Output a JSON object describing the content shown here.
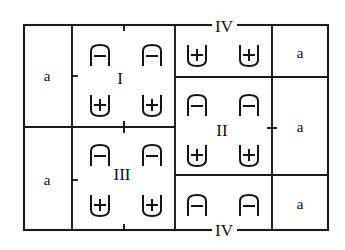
{
  "diagram": {
    "type": "physics-region-sketch",
    "outer_border": {
      "x": 24,
      "y": 25,
      "width": 304,
      "height": 205
    },
    "colors": {
      "line": "#1a1a1a",
      "glyph": "#141414",
      "background": "#ffffff",
      "text": "#111111"
    },
    "grid": {
      "vertical_lines_x": [
        24,
        72,
        175,
        272,
        328
      ],
      "horizontal_lines_left_y": [
        25,
        127,
        230
      ],
      "horizontal_lines_right_y": [
        25,
        77,
        175,
        230
      ]
    },
    "region_labels": [
      {
        "name": "region-I",
        "text": "I",
        "x": 120,
        "y": 78,
        "placement": "interior"
      },
      {
        "name": "region-II",
        "text": "II",
        "x": 222,
        "y": 130,
        "placement": "interior"
      },
      {
        "name": "region-III",
        "text": "III",
        "x": 122,
        "y": 174,
        "placement": "interior"
      },
      {
        "name": "region-IV-top",
        "text": "IV",
        "x": 224,
        "y": 30,
        "placement": "on-top-border"
      },
      {
        "name": "region-IV-bottom",
        "text": "IV",
        "x": 224,
        "y": 234,
        "placement": "on-bottom-border"
      }
    ],
    "medium_labels": [
      {
        "name": "medium-left-upper",
        "text": "a",
        "x": 47,
        "y": 76
      },
      {
        "name": "medium-left-lower",
        "text": "a",
        "x": 47,
        "y": 180
      },
      {
        "name": "medium-right-upper",
        "text": "a",
        "x": 300,
        "y": 54
      },
      {
        "name": "medium-right-middle",
        "text": "a",
        "x": 300,
        "y": 128
      },
      {
        "name": "medium-right-lower",
        "text": "a",
        "x": 300,
        "y": 205
      }
    ],
    "charges": [
      {
        "name": "charge-I-tl",
        "sign": "-",
        "bracket": "arch",
        "x": 100,
        "y": 55,
        "region": "I"
      },
      {
        "name": "charge-I-tr",
        "sign": "-",
        "bracket": "arch",
        "x": 152,
        "y": 55,
        "region": "I"
      },
      {
        "name": "charge-I-bl",
        "sign": "+",
        "bracket": "cup",
        "x": 100,
        "y": 105,
        "region": "I"
      },
      {
        "name": "charge-I-br",
        "sign": "+",
        "bracket": "cup",
        "x": 152,
        "y": 105,
        "region": "I"
      },
      {
        "name": "charge-IVtop-l",
        "sign": "+",
        "bracket": "cup",
        "x": 197,
        "y": 55,
        "region": "IV-top"
      },
      {
        "name": "charge-IVtop-r",
        "sign": "+",
        "bracket": "cup",
        "x": 249,
        "y": 55,
        "region": "IV-top"
      },
      {
        "name": "charge-II-tl",
        "sign": "-",
        "bracket": "arch",
        "x": 197,
        "y": 105,
        "region": "II"
      },
      {
        "name": "charge-II-tr",
        "sign": "-",
        "bracket": "arch",
        "x": 249,
        "y": 105,
        "region": "II"
      },
      {
        "name": "charge-II-bl",
        "sign": "+",
        "bracket": "cup",
        "x": 197,
        "y": 155,
        "region": "II"
      },
      {
        "name": "charge-II-br",
        "sign": "+",
        "bracket": "cup",
        "x": 249,
        "y": 155,
        "region": "II"
      },
      {
        "name": "charge-III-tl",
        "sign": "-",
        "bracket": "arch",
        "x": 100,
        "y": 155,
        "region": "III"
      },
      {
        "name": "charge-III-tr",
        "sign": "-",
        "bracket": "arch",
        "x": 152,
        "y": 155,
        "region": "III"
      },
      {
        "name": "charge-III-bl",
        "sign": "+",
        "bracket": "cup",
        "x": 100,
        "y": 205,
        "region": "III"
      },
      {
        "name": "charge-III-br",
        "sign": "+",
        "bracket": "cup",
        "x": 152,
        "y": 205,
        "region": "III"
      },
      {
        "name": "charge-IVbot-l",
        "sign": "-",
        "bracket": "arch",
        "x": 197,
        "y": 205,
        "region": "IV-bottom"
      },
      {
        "name": "charge-IVbot-r",
        "sign": "-",
        "bracket": "arch",
        "x": 249,
        "y": 205,
        "region": "IV-bottom"
      }
    ],
    "tick_marks": [
      {
        "name": "tick-left-mid-upper",
        "x": 72,
        "y": 76
      },
      {
        "name": "tick-left-mid-lower",
        "x": 72,
        "y": 180
      },
      {
        "name": "tick-mid-top",
        "x": 124,
        "y": 25
      },
      {
        "name": "tick-mid-center",
        "x": 124,
        "y": 127
      },
      {
        "name": "tick-mid-bottom",
        "x": 124,
        "y": 230
      },
      {
        "name": "tick-right-mid",
        "x": 272,
        "y": 128
      }
    ]
  }
}
